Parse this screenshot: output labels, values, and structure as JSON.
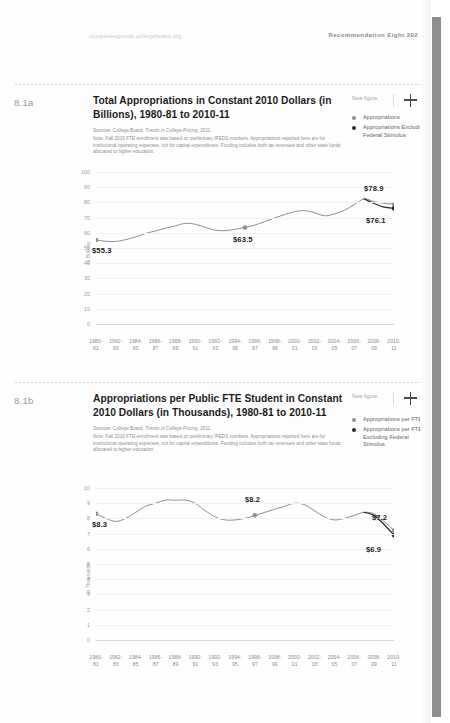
{
  "runhead": {
    "url": "completeagenda.collegeboard.org",
    "recommendation": "Recommendation Eight  202"
  },
  "controls": {
    "new_figure_label": "New figure",
    "add_icon": "plus-icon"
  },
  "colors": {
    "series_primary": "#8f8f8f",
    "series_secondary": "#2a2a2a",
    "grid": "#f1f1f1",
    "axis": "#d8d8d8",
    "muted_text": "#9a9a9a",
    "scrollbar": "#8e8e8e"
  },
  "figures": [
    {
      "number": "8.1a",
      "title": "Total Appropriations in Constant 2010 Dollars (in Billions), 1980-81 to 2010-11",
      "sources_prefix": "Sources: College Board, ",
      "sources_italic": "Trends in College Pricing",
      "sources_suffix": ", 2011",
      "note": "Note: Fall 2010 FTE enrollment was based on preliminary IPEDS numbers. Appropriations reported here are for institutional operating expenses, not for capital expenditures. Funding includes both tax revenues and other state funds allocated to higher education.",
      "legend": [
        {
          "label": "Appropriations",
          "color": "gray"
        },
        {
          "label": "Appropriations Excluding Federal Stimulus",
          "color": "dark"
        }
      ]
    },
    {
      "number": "8.1b",
      "title": "Appropriations per Public FTE Student in Constant 2010 Dollars (in Thousands), 1980-81 to 2010-11",
      "sources_prefix": "Sources: College Board, ",
      "sources_italic": "Trends in College Pricing",
      "sources_suffix": ", 2011",
      "note": "Note: Fall 2010 FTE enrollment was based on preliminary IPEDS numbers. Appropriations reported here are for institutional operating expenses, not for capital expenditures. Funding includes both tax revenues and other state funds allocated to higher education.",
      "legend": [
        {
          "label": "Appropriations per FTE",
          "color": "gray"
        },
        {
          "label": "Appropriations per FTE Excluding Federal Stimulus",
          "color": "dark"
        }
      ]
    }
  ],
  "chart_data": [
    {
      "type": "line",
      "title": "Total Appropriations in Constant 2010 Dollars (in Billions), 1980-81 to 2010-11",
      "xlabel": "",
      "ylabel": "In Billions",
      "ylim": [
        0,
        100
      ],
      "yticks": [
        0,
        10,
        20,
        30,
        40,
        50,
        60,
        70,
        80,
        90,
        100
      ],
      "grid": true,
      "legend_position": "top-right",
      "categories": [
        "1980-81",
        "1981-82",
        "1982-83",
        "1983-84",
        "1984-85",
        "1985-86",
        "1986-87",
        "1987-88",
        "1988-89",
        "1989-90",
        "1990-91",
        "1991-92",
        "1992-93",
        "1993-94",
        "1994-95",
        "1995-96",
        "1996-97",
        "1997-98",
        "1998-99",
        "1999-00",
        "2000-01",
        "2001-02",
        "2002-03",
        "2003-04",
        "2004-05",
        "2005-06",
        "2006-07",
        "2007-08",
        "2008-09",
        "2009-10",
        "2010-11"
      ],
      "tick_labels": [
        "1980-81",
        "1982-83",
        "1984-85",
        "1986-87",
        "1988-89",
        "1990-91",
        "1992-93",
        "1994-95",
        "1996-97",
        "1998-99",
        "2000-01",
        "2002-03",
        "2004-05",
        "2006-07",
        "2008-09",
        "2010-11"
      ],
      "series": [
        {
          "name": "Appropriations",
          "color": "#8f8f8f",
          "values": [
            55.3,
            54.4,
            54.3,
            55.5,
            57.3,
            59.6,
            61.2,
            63.0,
            64.6,
            66.2,
            65.6,
            63.6,
            61.7,
            61.4,
            62.3,
            63.5,
            65.1,
            67.4,
            69.8,
            72.0,
            73.9,
            74.6,
            73.2,
            71.2,
            72.4,
            74.8,
            78.5,
            82.3,
            80.5,
            79.4,
            78.9
          ]
        },
        {
          "name": "Appropriations Excluding Federal Stimulus",
          "color": "#2a2a2a",
          "values": [
            null,
            null,
            null,
            null,
            null,
            null,
            null,
            null,
            null,
            null,
            null,
            null,
            null,
            null,
            null,
            null,
            null,
            null,
            null,
            null,
            null,
            null,
            null,
            null,
            null,
            null,
            null,
            82.3,
            79.3,
            76.9,
            76.1
          ]
        }
      ],
      "annotations": [
        {
          "text": "$55.3",
          "category": "1980-81",
          "value": 55.3
        },
        {
          "text": "$63.5",
          "category": "1995-96",
          "value": 63.5
        },
        {
          "text": "$78.9",
          "category": "2010-11",
          "value": 78.9
        },
        {
          "text": "$76.1",
          "category": "2010-11",
          "value": 76.1
        }
      ]
    },
    {
      "type": "line",
      "title": "Appropriations per Public FTE Student in Constant 2010 Dollars (in Thousands), 1980-81 to 2010-11",
      "xlabel": "",
      "ylabel": "In Thousands",
      "ylim": [
        0,
        10
      ],
      "yticks": [
        0,
        1,
        2,
        3,
        4,
        5,
        6,
        7,
        8,
        9,
        10
      ],
      "grid": true,
      "legend_position": "top-right",
      "categories": [
        "1980-81",
        "1981-82",
        "1982-83",
        "1983-84",
        "1984-85",
        "1985-86",
        "1986-87",
        "1987-88",
        "1988-89",
        "1989-90",
        "1990-91",
        "1991-92",
        "1992-93",
        "1993-94",
        "1994-95",
        "1995-96",
        "1996-97",
        "1997-98",
        "1998-99",
        "1999-00",
        "2000-01",
        "2001-02",
        "2002-03",
        "2003-04",
        "2004-05",
        "2005-06",
        "2006-07",
        "2007-08",
        "2008-09",
        "2009-10",
        "2010-11"
      ],
      "tick_labels": [
        "1980-81",
        "1982-83",
        "1984-85",
        "1986-87",
        "1988-89",
        "1990-91",
        "1992-93",
        "1994-95",
        "1996-97",
        "1998-99",
        "2000-01",
        "2002-03",
        "2004-05",
        "2006-07",
        "2008-09",
        "2010-11"
      ],
      "series": [
        {
          "name": "Appropriations per FTE",
          "color": "#8f8f8f",
          "values": [
            8.3,
            8.0,
            7.8,
            8.0,
            8.4,
            8.8,
            9.0,
            9.2,
            9.2,
            9.2,
            9.0,
            8.5,
            8.1,
            7.9,
            7.9,
            8.0,
            8.2,
            8.4,
            8.6,
            8.8,
            9.0,
            8.9,
            8.5,
            8.1,
            7.9,
            8.0,
            8.2,
            8.4,
            8.3,
            7.8,
            7.2
          ]
        },
        {
          "name": "Appropriations per FTE Excluding Federal Stimulus",
          "color": "#2a2a2a",
          "values": [
            null,
            null,
            null,
            null,
            null,
            null,
            null,
            null,
            null,
            null,
            null,
            null,
            null,
            null,
            null,
            null,
            null,
            null,
            null,
            null,
            null,
            null,
            null,
            null,
            null,
            null,
            null,
            8.4,
            8.2,
            7.6,
            6.9
          ]
        }
      ],
      "annotations": [
        {
          "text": "$8.3",
          "category": "1980-81",
          "value": 8.3
        },
        {
          "text": "$8.2",
          "category": "1996-97",
          "value": 8.2
        },
        {
          "text": "$7.2",
          "category": "2010-11",
          "value": 7.2
        },
        {
          "text": "$6.9",
          "category": "2010-11",
          "value": 6.9
        }
      ]
    }
  ]
}
